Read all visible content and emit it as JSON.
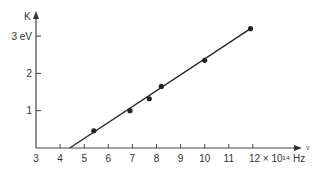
{
  "chart_data": {
    "type": "scatter",
    "title": "",
    "xlabel": "ν",
    "ylabel": "K",
    "x_unit_label": "× 10¹⁴ Hz",
    "y_unit_label": "eV",
    "xlim": [
      3,
      12.5
    ],
    "ylim": [
      0,
      3.5
    ],
    "x_ticks": [
      3,
      4,
      5,
      6,
      7,
      8,
      9,
      10,
      11,
      12
    ],
    "x_tick_labels": [
      "3",
      "4",
      "5",
      "6",
      "7",
      "8",
      "9",
      "10",
      "11",
      "12 × 10¹⁴ Hz"
    ],
    "y_ticks": [
      1,
      2,
      3
    ],
    "y_tick_labels": [
      "1",
      "2",
      "3 eV"
    ],
    "grid": false,
    "series": [
      {
        "name": "measurements",
        "x": [
          5.4,
          6.9,
          7.7,
          8.2,
          10.0,
          11.9
        ],
        "y": [
          0.46,
          1.0,
          1.32,
          1.65,
          2.35,
          3.2
        ]
      }
    ],
    "fit_line": {
      "x": [
        4.4,
        11.9
      ],
      "y": [
        0,
        3.2
      ]
    }
  },
  "axes": {
    "y_axis_label": "K",
    "x_axis_label": "ν"
  }
}
